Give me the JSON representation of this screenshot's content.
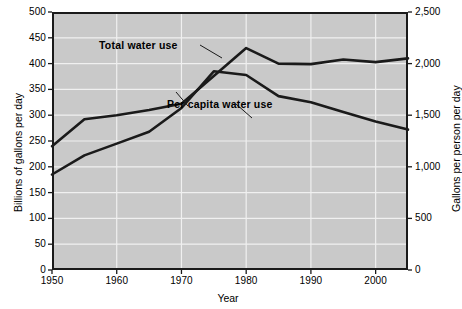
{
  "chart_data": {
    "type": "line",
    "title": "",
    "xlabel": "Year",
    "ylabel": "Billions of gallons per day",
    "ylabel_right": "Gallons per person per day",
    "xlim": [
      1950,
      2005
    ],
    "ylim": [
      0,
      500
    ],
    "ylim_right": [
      0,
      2500
    ],
    "grid": true,
    "legend_position": "inline-annotation",
    "xticks": [
      1950,
      1960,
      1970,
      1980,
      1990,
      2000
    ],
    "xtick_labels": [
      "1950",
      "1960",
      "1970",
      "1980",
      "1990",
      "2000"
    ],
    "yticks_left": [
      0,
      50,
      100,
      150,
      200,
      250,
      300,
      350,
      400,
      450,
      500
    ],
    "ytick_labels_left": [
      "0",
      "50",
      "100",
      "150",
      "200",
      "250",
      "300",
      "350",
      "400",
      "450",
      "500"
    ],
    "yticks_right": [
      0,
      500,
      1000,
      1500,
      2000,
      2500
    ],
    "ytick_labels_right": [
      "0",
      "500",
      "1,000",
      "1,500",
      "2,000",
      "2,500"
    ],
    "x": [
      1950,
      1955,
      1960,
      1965,
      1970,
      1975,
      1980,
      1985,
      1990,
      1995,
      2000,
      2005
    ],
    "series": [
      {
        "name": "Total water use",
        "axis": "left",
        "units": "billions of gallons per day",
        "values": [
          240,
          292,
          300,
          310,
          322,
          376,
          430,
          400,
          399,
          408,
          403,
          410
        ]
      },
      {
        "name": "Per capita water use",
        "axis": "right",
        "units": "gallons per person per day",
        "values": [
          925,
          1110,
          1225,
          1340,
          1570,
          1925,
          1890,
          1685,
          1625,
          1530,
          1440,
          1360
        ]
      }
    ],
    "annotations": [
      {
        "text": "Total water use",
        "for": "Total water use"
      },
      {
        "text": "Per capita water use",
        "for": "Per capita water use"
      }
    ],
    "colors": {
      "plot_background": "#c9c9c9",
      "grid": "#f0f0f0",
      "line": "#1a1a1a",
      "axis": "#1a1a1a",
      "text": "#000000"
    }
  }
}
